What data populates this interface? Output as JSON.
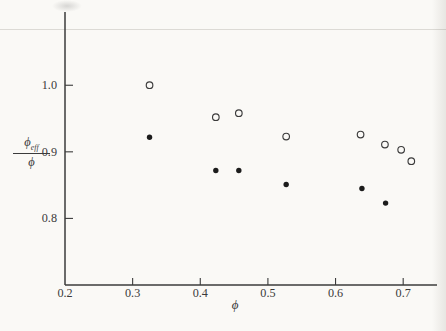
{
  "colors": {
    "paper": "#faf9f6",
    "ink": "#3b3b3b",
    "point_fill": "#1c1c1c",
    "rule_line": "#dcdad5"
  },
  "chart_data": {
    "type": "scatter",
    "title": "",
    "xlabel": "ϕ",
    "ylabel": {
      "numerator": "ϕ",
      "numerator_sub": "eff",
      "denominator": "ϕ"
    },
    "xlim": [
      0.2,
      0.75
    ],
    "ylim": [
      0.7,
      1.11
    ],
    "grid": false,
    "legend_position": "none",
    "xticks": [
      {
        "v": 0.2,
        "label": "0.2",
        "mark": false
      },
      {
        "v": 0.3,
        "label": "0.3",
        "mark": true
      },
      {
        "v": 0.4,
        "label": "0.4",
        "mark": true
      },
      {
        "v": 0.5,
        "label": "0.5",
        "mark": true
      },
      {
        "v": 0.6,
        "label": "0.6",
        "mark": true
      },
      {
        "v": 0.7,
        "label": "0.7",
        "mark": true
      }
    ],
    "yticks": [
      {
        "v": 0.8,
        "label": "0.8"
      },
      {
        "v": 0.9,
        "label": "0.9"
      },
      {
        "v": 1.0,
        "label": "1.0"
      }
    ],
    "series": [
      {
        "name": "open-circles",
        "marker": "open",
        "points": [
          [
            0.325,
            1.0
          ],
          [
            0.423,
            0.952
          ],
          [
            0.457,
            0.958
          ],
          [
            0.527,
            0.923
          ],
          [
            0.637,
            0.926
          ],
          [
            0.673,
            0.911
          ],
          [
            0.697,
            0.903
          ],
          [
            0.712,
            0.886
          ]
        ]
      },
      {
        "name": "filled-circles",
        "marker": "filled",
        "points": [
          [
            0.325,
            0.922
          ],
          [
            0.423,
            0.872
          ],
          [
            0.457,
            0.872
          ],
          [
            0.527,
            0.851
          ],
          [
            0.639,
            0.845
          ],
          [
            0.674,
            0.823
          ]
        ]
      }
    ]
  }
}
